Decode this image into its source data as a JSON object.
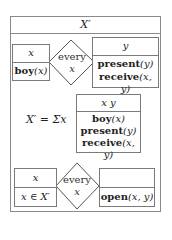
{
  "title": "X′",
  "top_row": {
    "left_box": {
      "referent": "x",
      "conditions": [
        {
          "pred": "boy",
          "args": "(x)"
        }
      ]
    },
    "quantifier": {
      "word": "every",
      "variable": "x"
    },
    "right_box": {
      "referent": "y",
      "conditions": [
        {
          "pred": "present",
          "args": "(y)"
        },
        {
          "pred": "receive",
          "args": "(x, y)"
        }
      ]
    }
  },
  "middle": {
    "equation": "X′ = Σx",
    "box": {
      "referent": "x y",
      "conditions": [
        {
          "pred": "boy",
          "args": "(x)"
        },
        {
          "pred": "present",
          "args": "(y)"
        },
        {
          "pred": "receive",
          "args": "(x, y)"
        }
      ]
    }
  },
  "bottom_row": {
    "left_box": {
      "referent": "x",
      "condition": "x ∈ X′"
    },
    "quantifier": {
      "word": "every",
      "variable": "x"
    },
    "right_box": {
      "referent": "",
      "conditions": [
        {
          "pred": "open",
          "args": "(x, y)"
        }
      ]
    }
  }
}
